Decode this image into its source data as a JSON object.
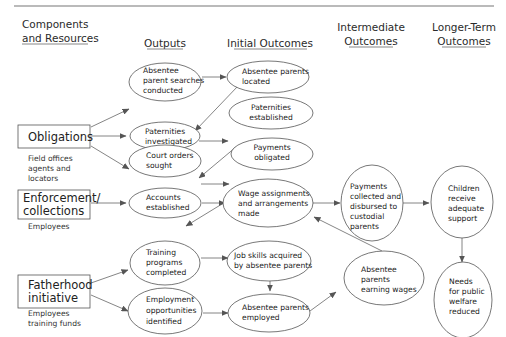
{
  "headers": {
    "components": [
      "Components",
      "and Resources"
    ],
    "outputs": "Outputs",
    "initial": "Initial Outcomes",
    "intermediate": [
      "Intermediate",
      "Outcomes"
    ],
    "longer": [
      "Longer-Term",
      "Outcomes"
    ]
  },
  "components": [
    {
      "id": "obligations",
      "label": [
        "Obligations"
      ],
      "resources": [
        "Field offices",
        "agents and",
        "locators"
      ]
    },
    {
      "id": "enforcement",
      "label": [
        "Enforcement/",
        "collections"
      ],
      "resources": [
        "Employees"
      ]
    },
    {
      "id": "fatherhood",
      "label": [
        "Fatherhood",
        "initiative"
      ],
      "resources": [
        "Employees",
        "training funds"
      ]
    }
  ],
  "outputs": [
    {
      "id": "searches",
      "lines": [
        "Absentee",
        "parent searches",
        "conducted"
      ]
    },
    {
      "id": "pat_inv",
      "lines": [
        "Paternities",
        "investigated"
      ]
    },
    {
      "id": "court",
      "lines": [
        "Court orders",
        "sought"
      ]
    },
    {
      "id": "accounts",
      "lines": [
        "Accounts",
        "established"
      ]
    },
    {
      "id": "training",
      "lines": [
        "Training",
        "programs",
        "completed"
      ]
    },
    {
      "id": "employment",
      "lines": [
        "Employment",
        "opportunities",
        "identified"
      ]
    }
  ],
  "initial": [
    {
      "id": "located",
      "lines": [
        "Absentee parents",
        "located"
      ]
    },
    {
      "id": "pat_est",
      "lines": [
        "Paternities",
        "established"
      ]
    },
    {
      "id": "obligated",
      "lines": [
        "Payments",
        "obligated"
      ]
    },
    {
      "id": "wage",
      "lines": [
        "Wage assignments",
        "and arrangements",
        "made"
      ]
    },
    {
      "id": "jobskills",
      "lines": [
        "Job skills acquired",
        "by absentee parents"
      ]
    },
    {
      "id": "employed",
      "lines": [
        "Absentee parents",
        "employed"
      ]
    }
  ],
  "intermediate": [
    {
      "id": "collected",
      "lines": [
        "Payments",
        "collected and",
        "disbursed to",
        "custodial",
        "parents"
      ]
    },
    {
      "id": "earning",
      "lines": [
        "Absentee",
        "parents",
        "earning wages"
      ]
    }
  ],
  "longer": [
    {
      "id": "children",
      "lines": [
        "Children",
        "receive",
        "adequate",
        "support"
      ]
    },
    {
      "id": "welfare",
      "lines": [
        "Needs",
        "for public",
        "welfare",
        "reduced"
      ]
    }
  ],
  "edges": [
    [
      "obligations",
      "searches"
    ],
    [
      "obligations",
      "pat_inv"
    ],
    [
      "obligations",
      "court"
    ],
    [
      "searches",
      "located"
    ],
    [
      "located",
      "pat_inv"
    ],
    [
      "pat_inv",
      "pat_est"
    ],
    [
      "pat_est",
      "court"
    ],
    [
      "court",
      "obligated"
    ],
    [
      "obligated",
      "accounts"
    ],
    [
      "enforcement",
      "accounts"
    ],
    [
      "accounts",
      "wage"
    ],
    [
      "wage",
      "collected"
    ],
    [
      "fatherhood",
      "training"
    ],
    [
      "fatherhood",
      "employment"
    ],
    [
      "training",
      "jobskills"
    ],
    [
      "jobskills",
      "employed"
    ],
    [
      "employment",
      "employed"
    ],
    [
      "employed",
      "earning"
    ],
    [
      "earning",
      "wage"
    ],
    [
      "collected",
      "children"
    ],
    [
      "children",
      "welfare"
    ]
  ]
}
